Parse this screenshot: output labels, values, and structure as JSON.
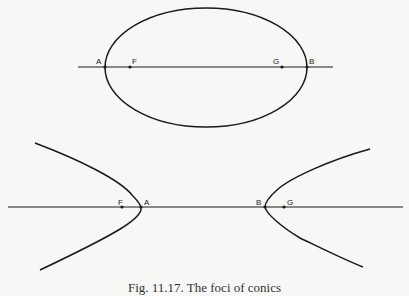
{
  "ellipse_figure": {
    "labels": {
      "A": "A",
      "F": "F",
      "G": "G",
      "B": "B"
    }
  },
  "hyperbola_figure": {
    "labels": {
      "F": "F",
      "A": "A",
      "B": "B",
      "G": "G"
    }
  },
  "caption": "Fig. 11.17. The foci of conics",
  "colors": {
    "stroke": "#1a1a1a",
    "background": "#f7f7f5"
  }
}
